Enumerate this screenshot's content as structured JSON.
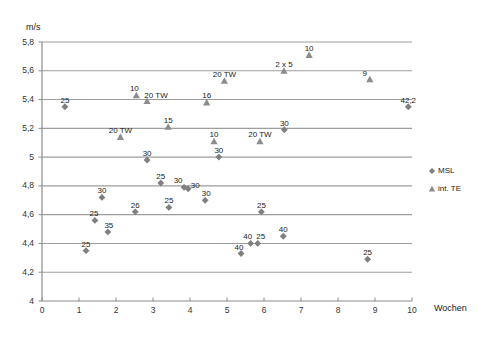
{
  "chart_data": {
    "type": "scatter",
    "title": "",
    "xlabel": "Wochen",
    "ylabel": "m/s",
    "xlim": [
      0,
      10
    ],
    "ylim": [
      4,
      5.8
    ],
    "grid": true,
    "legend_position": "right",
    "x_ticks": [
      "0",
      "1",
      "2",
      "3",
      "4",
      "5",
      "6",
      "7",
      "8",
      "9",
      "10"
    ],
    "y_ticks": [
      "4",
      "4,2",
      "4,4",
      "4,6",
      "4,8",
      "5",
      "5,2",
      "5,4",
      "5,6",
      "5,8"
    ],
    "series": [
      {
        "name": "MSL",
        "marker": "diamond",
        "color": "#7f7f7f",
        "points": [
          {
            "x": 0.62,
            "y": 5.35,
            "label": "25",
            "lx": 0,
            "ly": -11
          },
          {
            "x": 1.19,
            "y": 4.35,
            "label": "25",
            "lx": 0,
            "ly": -11
          },
          {
            "x": 1.43,
            "y": 4.56,
            "label": "25",
            "lx": -1,
            "ly": -11
          },
          {
            "x": 1.62,
            "y": 4.72,
            "label": "30",
            "lx": 0,
            "ly": -11
          },
          {
            "x": 1.78,
            "y": 4.48,
            "label": "35",
            "lx": 1,
            "ly": -11
          },
          {
            "x": 2.52,
            "y": 4.62,
            "label": "26",
            "lx": 0,
            "ly": -11
          },
          {
            "x": 2.84,
            "y": 4.98,
            "label": "30",
            "lx": 0,
            "ly": -11
          },
          {
            "x": 3.21,
            "y": 4.82,
            "label": "25",
            "lx": 0,
            "ly": -11
          },
          {
            "x": 3.43,
            "y": 4.65,
            "label": "25",
            "lx": 0,
            "ly": -11
          },
          {
            "x": 3.84,
            "y": 4.79,
            "label": "30",
            "lx": -6,
            "ly": -11
          },
          {
            "x": 3.95,
            "y": 4.78,
            "label": "30",
            "lx": 7,
            "ly": -8
          },
          {
            "x": 4.41,
            "y": 4.7,
            "label": "30",
            "lx": 1,
            "ly": -11
          },
          {
            "x": 4.78,
            "y": 5.0,
            "label": "30",
            "lx": 0,
            "ly": -11
          },
          {
            "x": 5.38,
            "y": 4.33,
            "label": "40",
            "lx": -2,
            "ly": -11
          },
          {
            "x": 5.64,
            "y": 4.4,
            "label": "40",
            "lx": -3,
            "ly": -11
          },
          {
            "x": 5.83,
            "y": 4.4,
            "label": "25",
            "lx": 3,
            "ly": -11
          },
          {
            "x": 5.93,
            "y": 4.62,
            "label": "25",
            "lx": 0,
            "ly": -11
          },
          {
            "x": 6.52,
            "y": 4.45,
            "label": "40",
            "lx": 0,
            "ly": -11
          },
          {
            "x": 6.55,
            "y": 5.19,
            "label": "30",
            "lx": 0,
            "ly": -11
          },
          {
            "x": 8.8,
            "y": 4.29,
            "label": "25",
            "lx": 0,
            "ly": -11
          },
          {
            "x": 9.9,
            "y": 5.35,
            "label": "42,2",
            "lx": 0,
            "ly": -11
          }
        ]
      },
      {
        "name": "int. TE",
        "marker": "triangle",
        "color": "#8c8c8c",
        "points": [
          {
            "x": 2.12,
            "y": 5.14,
            "label": "20 TW",
            "lx": 0,
            "ly": -11
          },
          {
            "x": 2.55,
            "y": 5.43,
            "label": "10",
            "lx": -2,
            "ly": -11
          },
          {
            "x": 2.84,
            "y": 5.39,
            "label": "20 TW",
            "lx": 9,
            "ly": -10
          },
          {
            "x": 3.41,
            "y": 5.21,
            "label": "15",
            "lx": 0,
            "ly": -11
          },
          {
            "x": 4.45,
            "y": 5.38,
            "label": "16",
            "lx": 0,
            "ly": -11
          },
          {
            "x": 4.65,
            "y": 5.11,
            "label": "10",
            "lx": 0,
            "ly": -11
          },
          {
            "x": 4.93,
            "y": 5.53,
            "label": "20 TW",
            "lx": 0,
            "ly": -11
          },
          {
            "x": 5.89,
            "y": 5.11,
            "label": "20 TW",
            "lx": 0,
            "ly": -11
          },
          {
            "x": 6.54,
            "y": 5.6,
            "label": "2 x 5",
            "lx": 0,
            "ly": -11
          },
          {
            "x": 7.22,
            "y": 5.71,
            "label": "10",
            "lx": 0,
            "ly": -11
          },
          {
            "x": 8.86,
            "y": 5.54,
            "label": "9",
            "lx": -5,
            "ly": -10
          }
        ]
      }
    ]
  },
  "axes": {
    "y_unit_label": "m/s",
    "x_unit_label": "Wochen"
  },
  "legend": {
    "entries": [
      {
        "label": "MSL",
        "marker": "diamond"
      },
      {
        "label": "int. TE",
        "marker": "triangle"
      }
    ]
  },
  "colors": {
    "marker_msl": "#7f7f7f",
    "marker_te": "#8c8c8c",
    "gridline": "#9d9d9d",
    "axis": "#8c8c8c",
    "text": "#222222",
    "background": "#ffffff"
  },
  "geometry": {
    "plot_left": 42,
    "plot_right": 412,
    "plot_top": 42,
    "plot_bottom": 301
  }
}
